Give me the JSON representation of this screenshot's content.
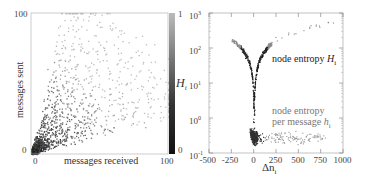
{
  "chart_data": [
    {
      "type": "scatter",
      "title": "",
      "xlabel": "messages received",
      "ylabel": "messages sent",
      "xlim": [
        0,
        100
      ],
      "ylim": [
        0,
        100
      ],
      "x_ticks": [
        "0",
        "100"
      ],
      "y_ticks": [
        "0",
        "100"
      ],
      "colorbar": {
        "label": "H_i",
        "label_main": "H",
        "label_sub": "i",
        "ticks": [
          "0",
          "1"
        ],
        "range": [
          0,
          1
        ],
        "colors": [
          "#111111",
          "#bbbbbb"
        ]
      },
      "grid": false,
      "description": "Dense cloud of points near origin (dark, low H_i), thinning toward upper right; points shaded by node entropy H_i"
    },
    {
      "type": "scatter",
      "title": "",
      "xlabel": "Δn_i",
      "xlabel_main": "Δn",
      "xlabel_sub": "i",
      "ylabel": "",
      "xlim": [
        -500,
        1000
      ],
      "ylim": [
        0.1,
        1000
      ],
      "yscale": "log",
      "x_ticks": [
        "-500",
        "-250",
        "0",
        "250",
        "500",
        "750",
        "1000"
      ],
      "y_ticks": [
        {
          "base": "10",
          "exp": "-1"
        },
        {
          "base": "10",
          "exp": "0"
        },
        {
          "base": "10",
          "exp": "1"
        },
        {
          "base": "10",
          "exp": "2"
        },
        {
          "base": "10",
          "exp": "3"
        }
      ],
      "grid": false,
      "series": [
        {
          "name": "node entropy H_i",
          "label_main": "node entropy ",
          "label_var": "H",
          "label_sub": "i",
          "color": "#222222",
          "description": "V-shaped curve with minimum near Δn=0 (~1), rising to ~100 at ±150 and ~500 at Δn≈900"
        },
        {
          "name": "node entropy per message h_i",
          "label_line1": "node entropy",
          "label_line2": "per message ",
          "label_var": "h",
          "label_sub": "i",
          "color": "#888888",
          "description": "Points clustered around 0.2–0.6, densest near Δn≈0–100"
        }
      ]
    }
  ]
}
